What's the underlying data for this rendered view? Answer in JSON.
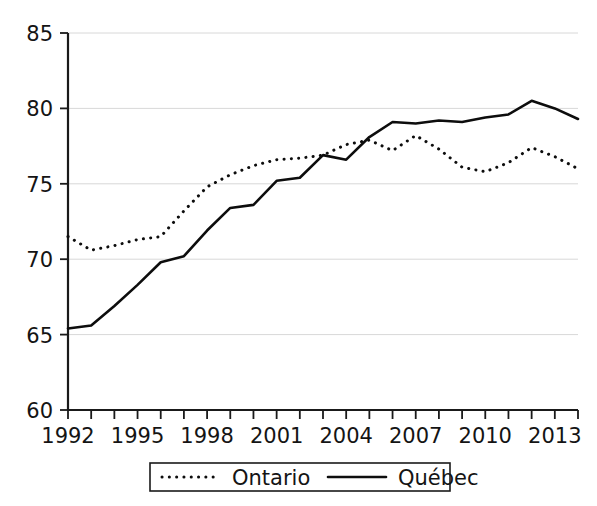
{
  "chart_data": {
    "type": "line",
    "title": "",
    "subtitle": "",
    "xlabel": "",
    "ylabel": "",
    "xlim": [
      1992,
      2014
    ],
    "ylim": [
      60,
      85
    ],
    "grid": true,
    "legend_position": "bottom",
    "y_ticks": [
      60,
      65,
      70,
      75,
      80,
      85
    ],
    "y_tick_labels": [
      "60",
      "65",
      "70",
      "75",
      "80",
      "85"
    ],
    "x_ticks": [
      1992,
      1993,
      1994,
      1995,
      1996,
      1997,
      1998,
      1999,
      2000,
      2001,
      2002,
      2003,
      2004,
      2005,
      2006,
      2007,
      2008,
      2009,
      2010,
      2011,
      2012,
      2013,
      2014
    ],
    "x_tick_labels": [
      "1992",
      "1995",
      "1998",
      "2001",
      "2004",
      "2007",
      "2010",
      "2013"
    ],
    "x_labeled_ticks": [
      1992,
      1995,
      1998,
      2001,
      2004,
      2007,
      2010,
      2013
    ],
    "x": [
      1992,
      1993,
      1994,
      1995,
      1996,
      1997,
      1998,
      1999,
      2000,
      2001,
      2002,
      2003,
      2004,
      2005,
      2006,
      2007,
      2008,
      2009,
      2010,
      2011,
      2012,
      2013,
      2014
    ],
    "series": [
      {
        "name": "Ontario",
        "style": "dotted",
        "color": "#0d0d0d",
        "values": [
          71.5,
          70.6,
          70.9,
          71.3,
          71.5,
          73.2,
          74.8,
          75.6,
          76.2,
          76.6,
          76.7,
          76.9,
          77.6,
          77.9,
          77.2,
          78.2,
          77.3,
          76.1,
          75.8,
          76.4,
          77.4,
          76.8,
          76.0
        ]
      },
      {
        "name": "Québec",
        "style": "solid",
        "color": "#0d0d0d",
        "values": [
          65.4,
          65.6,
          66.9,
          68.3,
          69.8,
          70.2,
          71.9,
          73.4,
          73.6,
          75.2,
          75.4,
          76.9,
          76.6,
          78.1,
          79.1,
          79.0,
          79.2,
          79.1,
          79.4,
          79.6,
          80.5,
          80.0,
          79.3
        ]
      }
    ],
    "legend": [
      {
        "label": "Ontario",
        "style": "dotted"
      },
      {
        "label": "Québec",
        "style": "solid"
      }
    ]
  }
}
